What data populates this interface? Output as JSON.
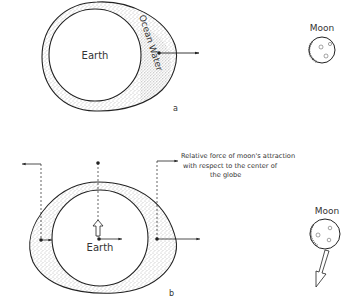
{
  "panel_a": {
    "earth_label": "Earth",
    "water_label": "Ocean Water",
    "moon_label": "Moon",
    "panel_label": "a"
  },
  "panel_b": {
    "earth_label": "Earth",
    "moon_label": "Moon",
    "panel_label": "b",
    "annotation": {
      "line1": "Relative force of moon's attraction",
      "line2": "with respect to the center of",
      "line3": "the globe"
    }
  },
  "colors": {
    "ink": "#222222",
    "stipple": "#8a8a8a",
    "background": "#ffffff"
  }
}
